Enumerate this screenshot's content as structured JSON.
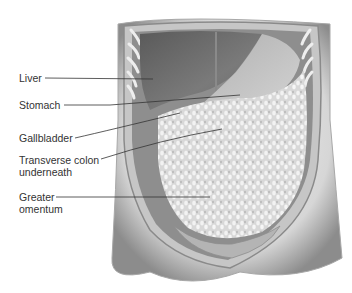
{
  "figure": {
    "labels": [
      {
        "id": "liver",
        "text": "Liver",
        "x": 19,
        "y": 62
      },
      {
        "id": "stomach",
        "text": "Stomach",
        "x": 19,
        "y": 90
      },
      {
        "id": "gallbladder",
        "text": "Gallbladder",
        "x": 19,
        "y": 121
      },
      {
        "id": "transverse-colon",
        "text": "Transverse colon",
        "text2": "underneath",
        "x": 19,
        "y": 142
      },
      {
        "id": "greater-omentum",
        "text": "Greater",
        "text2": "omentum",
        "x": 19,
        "y": 191
      }
    ]
  },
  "colors": {
    "skin_light": "#e8e8e8",
    "skin_shadow": "#9a9a9a",
    "liver": "#6e6e6e",
    "stomach": "#bdbdbd",
    "omentum": "#e4e4e4",
    "wall": "#d0d0d0",
    "leader_line": "#333333",
    "label_text": "#333333"
  }
}
